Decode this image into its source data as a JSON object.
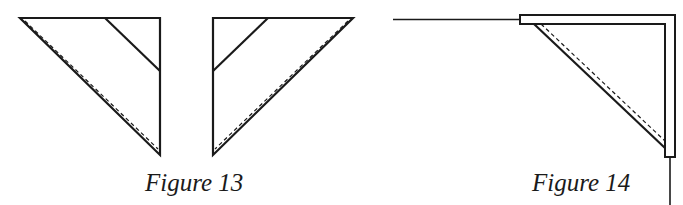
{
  "figures": [
    {
      "id": "figure-13",
      "caption": "Figure 13",
      "description": "Two right-triangle fabric pieces (mirror images) with a dashed stitching line along the hypotenuse and a diagonal line cutting across the right-angle corner"
    },
    {
      "id": "figure-14",
      "caption": "Figure 14",
      "description": "Triangle piece attached into an L-shaped corner binding, with a dashed stitching line along the diagonal edge and lines extending left and downward"
    }
  ],
  "colors": {
    "stroke": "#1a1a1a",
    "background": "#ffffff"
  }
}
